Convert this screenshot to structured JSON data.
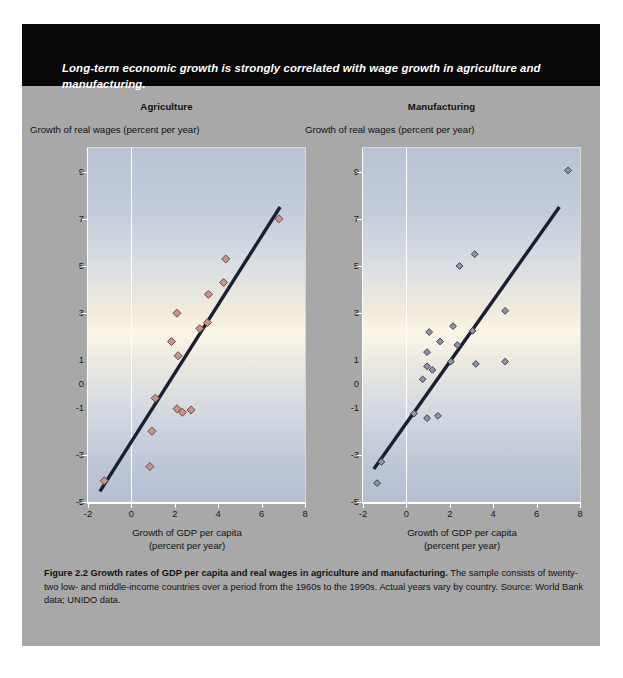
{
  "banner": {
    "headline": "Long-term economic growth is strongly correlated with wage growth in agriculture and manufacturing."
  },
  "caption": {
    "bold": "Figure 2.2  Growth rates of GDP per capita and real wages in agriculture and manufacturing.",
    "rest": " The sample consists of twenty-two low- and middle-income countries over a period from the 1960s to the 1990s. Actual years vary by country. Source: World Bank data; UNIDO data."
  },
  "colors": {
    "panel": "#a8a8a8",
    "banner": "#080808",
    "agriculture_marker": "#c4968c",
    "agriculture_marker_edge": "#6e4a44",
    "manufacturing_marker": "#8d94a4",
    "manufacturing_marker_edge": "#3b4250",
    "trendline": "#1b1f33"
  },
  "chart_data": [
    {
      "type": "scatter",
      "title": "Agriculture",
      "ylabel": "Growth of real wages (percent per year)",
      "xlabel": "Growth of GDP per capita\n(percent per year)",
      "xlabel_line1": "Growth of GDP per capita",
      "xlabel_line2": "(percent per year)",
      "xlim": [
        -2,
        8
      ],
      "ylim": [
        -5,
        10
      ],
      "xticks": [
        -2,
        0,
        2,
        4,
        6,
        8
      ],
      "xticklabels": [
        "-2",
        "0",
        "2",
        "4",
        "6",
        "8"
      ],
      "yticks": [
        9,
        7,
        5,
        3,
        1,
        0,
        -1,
        -3,
        -5
      ],
      "yticklabels": [
        "9",
        "7",
        "5",
        "3",
        "1",
        "0",
        "-1",
        "-3",
        "-5"
      ],
      "grid": true,
      "legend": "none",
      "points": [
        {
          "x": -1.25,
          "y": -4.1
        },
        {
          "x": 0.85,
          "y": -3.5
        },
        {
          "x": 1.1,
          "y": -0.6
        },
        {
          "x": 0.95,
          "y": -2.0
        },
        {
          "x": 2.1,
          "y": -1.05
        },
        {
          "x": 2.35,
          "y": -1.2
        },
        {
          "x": 2.75,
          "y": -1.1
        },
        {
          "x": 2.15,
          "y": 1.2
        },
        {
          "x": 1.85,
          "y": 1.8
        },
        {
          "x": 2.1,
          "y": 3.0
        },
        {
          "x": 3.15,
          "y": 2.35
        },
        {
          "x": 3.5,
          "y": 2.6
        },
        {
          "x": 3.55,
          "y": 3.8
        },
        {
          "x": 4.25,
          "y": 4.3
        },
        {
          "x": 4.35,
          "y": 5.3
        },
        {
          "x": 6.8,
          "y": 7.0
        }
      ],
      "trendline": {
        "x0": -1.45,
        "y0": -4.55,
        "x1": 6.85,
        "y1": 7.5
      }
    },
    {
      "type": "scatter",
      "title": "Manufacturing",
      "ylabel": "Growth of real wages (percent per year)",
      "xlabel_line1": "Growth of GDP per capita",
      "xlabel_line2": "(percent per year)",
      "xlim": [
        -2,
        8
      ],
      "ylim": [
        -5,
        10
      ],
      "xticks": [
        -2,
        0,
        2,
        4,
        6,
        8
      ],
      "xticklabels": [
        "-2",
        "0",
        "2",
        "4",
        "6",
        "8"
      ],
      "yticks": [
        9,
        7,
        5,
        3,
        1,
        0,
        -1,
        -3,
        -5
      ],
      "yticklabels": [
        "9",
        "7",
        "5",
        "3",
        "1",
        "0",
        "-1",
        "-3",
        "-5"
      ],
      "grid": true,
      "legend": "none",
      "points": [
        {
          "x": -1.35,
          "y": -4.2
        },
        {
          "x": -1.15,
          "y": -3.3
        },
        {
          "x": 0.35,
          "y": -1.25
        },
        {
          "x": 0.95,
          "y": -1.45
        },
        {
          "x": 1.45,
          "y": -1.35
        },
        {
          "x": 0.75,
          "y": 0.2
        },
        {
          "x": 0.95,
          "y": 0.75
        },
        {
          "x": 1.2,
          "y": 0.6
        },
        {
          "x": 0.95,
          "y": 1.35
        },
        {
          "x": 2.05,
          "y": 0.95
        },
        {
          "x": 3.2,
          "y": 0.85
        },
        {
          "x": 1.55,
          "y": 1.8
        },
        {
          "x": 2.35,
          "y": 1.65
        },
        {
          "x": 1.05,
          "y": 2.2
        },
        {
          "x": 2.15,
          "y": 2.45
        },
        {
          "x": 3.05,
          "y": 2.25
        },
        {
          "x": 4.55,
          "y": 0.95
        },
        {
          "x": 4.55,
          "y": 3.1
        },
        {
          "x": 2.45,
          "y": 5.0
        },
        {
          "x": 3.15,
          "y": 5.5
        },
        {
          "x": 7.45,
          "y": 9.05
        }
      ],
      "trendline": {
        "x0": -1.5,
        "y0": -3.6,
        "x1": 7.05,
        "y1": 7.5
      }
    }
  ]
}
